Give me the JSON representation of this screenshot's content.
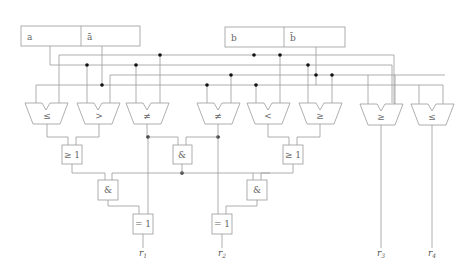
{
  "registers": {
    "a": {
      "label": "a",
      "label_neg": "ā"
    },
    "b": {
      "label": "b",
      "label_neg": "b̄"
    }
  },
  "comparators": [
    {
      "op": "≤"
    },
    {
      "op": ">"
    },
    {
      "op": "≠"
    },
    {
      "op": "≠"
    },
    {
      "op": "<"
    },
    {
      "op": "≥"
    },
    {
      "op": "≥"
    },
    {
      "op": "≤"
    }
  ],
  "gates": {
    "or_left": "≥ 1",
    "and_mid": "&",
    "or_right": "≥ 1",
    "and_left": "&",
    "and_right": "&",
    "xor_left": "= 1",
    "xor_right": "= 1"
  },
  "outputs": [
    "r1",
    "r2",
    "r3",
    "r4"
  ],
  "output_labels": {
    "r1": "r",
    "r1_sub": "1",
    "r2": "r",
    "r2_sub": "2",
    "r3": "r",
    "r3_sub": "3",
    "r4": "r",
    "r4_sub": "4"
  },
  "colors": {
    "wire": "#9a9a9a",
    "junction": "#111111",
    "text": "#666666"
  }
}
